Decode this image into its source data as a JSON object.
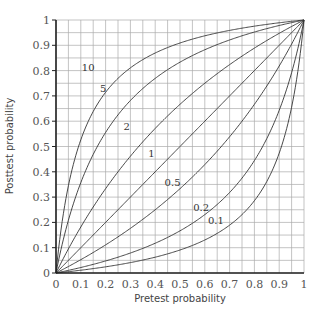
{
  "chart_data": {
    "type": "line",
    "title": "",
    "xlabel": "Pretest probability",
    "ylabel": "Posttest probability",
    "xlim": [
      0,
      1
    ],
    "ylim": [
      0,
      1
    ],
    "grid": true,
    "grid_step": 0.05,
    "x_ticks": [
      "0",
      "0.1",
      "0.2",
      "0.3",
      "0.4",
      "0.5",
      "0.6",
      "0.7",
      "0.8",
      "0.9",
      "1"
    ],
    "y_ticks": [
      "0",
      "0.1",
      "0.2",
      "0.3",
      "0.4",
      "0.5",
      "0.6",
      "0.7",
      "0.8",
      "0.9",
      "1"
    ],
    "formula": "post = LR*p / (LR*p + 1 - p)",
    "series": [
      {
        "name": "10",
        "likelihood_ratio": 10,
        "label_pos": [
          0.13,
          0.8
        ]
      },
      {
        "name": "5",
        "likelihood_ratio": 5,
        "label_pos": [
          0.19,
          0.715
        ]
      },
      {
        "name": "2",
        "likelihood_ratio": 2,
        "label_pos": [
          0.285,
          0.565
        ]
      },
      {
        "name": "1",
        "likelihood_ratio": 1,
        "label_pos": [
          0.385,
          0.46
        ]
      },
      {
        "name": "0.5",
        "likelihood_ratio": 0.5,
        "label_pos": [
          0.47,
          0.345
        ]
      },
      {
        "name": "0.2",
        "likelihood_ratio": 0.2,
        "label_pos": [
          0.585,
          0.245
        ]
      },
      {
        "name": "0.1",
        "likelihood_ratio": 0.1,
        "label_pos": [
          0.645,
          0.195
        ]
      }
    ],
    "sample_values": {
      "x": [
        0,
        0.1,
        0.2,
        0.3,
        0.4,
        0.5,
        0.6,
        0.7,
        0.8,
        0.9,
        1
      ],
      "LR_10": [
        0,
        0.526,
        0.714,
        0.811,
        0.87,
        0.909,
        0.938,
        0.959,
        0.976,
        0.989,
        1
      ],
      "LR_5": [
        0,
        0.357,
        0.556,
        0.682,
        0.769,
        0.833,
        0.882,
        0.921,
        0.952,
        0.978,
        1
      ],
      "LR_2": [
        0,
        0.182,
        0.333,
        0.462,
        0.571,
        0.667,
        0.75,
        0.824,
        0.889,
        0.947,
        1
      ],
      "LR_1": [
        0,
        0.1,
        0.2,
        0.3,
        0.4,
        0.5,
        0.6,
        0.7,
        0.8,
        0.9,
        1
      ],
      "LR_0.5": [
        0,
        0.053,
        0.111,
        0.176,
        0.25,
        0.333,
        0.429,
        0.538,
        0.667,
        0.818,
        1
      ],
      "LR_0.2": [
        0,
        0.022,
        0.048,
        0.079,
        0.118,
        0.167,
        0.231,
        0.318,
        0.444,
        0.643,
        1
      ],
      "LR_0.1": [
        0,
        0.011,
        0.024,
        0.041,
        0.063,
        0.091,
        0.13,
        0.189,
        0.286,
        0.474,
        1
      ]
    }
  },
  "colors": {
    "grid": "#aaaaaa",
    "axis": "#222222",
    "curve": "#333333",
    "text": "#555555"
  }
}
